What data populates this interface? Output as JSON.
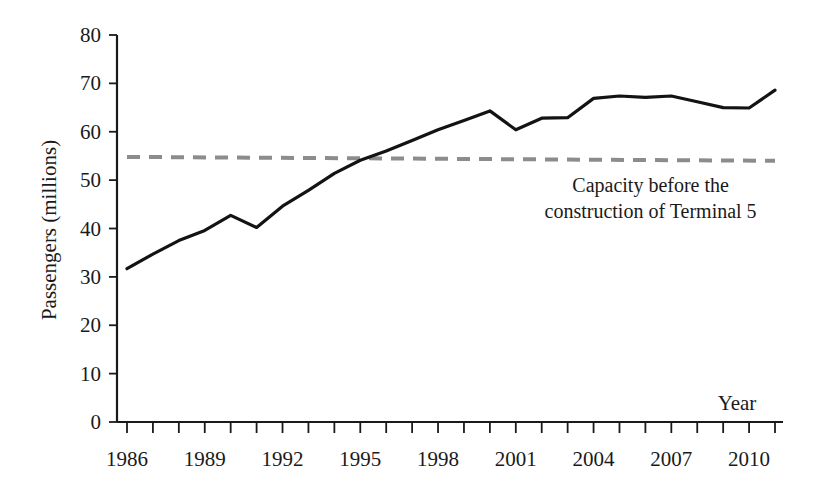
{
  "chart_data": {
    "type": "line",
    "title": "",
    "xlabel": "Year",
    "ylabel": "Passengers (millions)",
    "xlim": [
      1986,
      2011
    ],
    "ylim": [
      0,
      80
    ],
    "grid": false,
    "legend": "none",
    "y_ticks": [
      0,
      10,
      20,
      30,
      40,
      50,
      60,
      70,
      80
    ],
    "y_tick_labels": [
      "0",
      "10",
      "20",
      "30",
      "40",
      "50",
      "60",
      "70",
      "80"
    ],
    "x_ticks": [
      1986,
      1987,
      1988,
      1989,
      1990,
      1991,
      1992,
      1993,
      1994,
      1995,
      1996,
      1997,
      1998,
      1999,
      2000,
      2001,
      2002,
      2003,
      2004,
      2005,
      2006,
      2007,
      2008,
      2009,
      2010,
      2011
    ],
    "x_tick_labels_shown": [
      "1986",
      "1989",
      "1992",
      "1995",
      "1998",
      "2001",
      "2004",
      "2007",
      "2010"
    ],
    "x_tick_label_years": [
      1986,
      1989,
      1992,
      1995,
      1998,
      2001,
      2004,
      2007,
      2010
    ],
    "series": [
      {
        "name": "Passengers",
        "style": "solid",
        "color": "#131313",
        "x": [
          1986,
          1987,
          1988,
          1989,
          1990,
          1991,
          1992,
          1993,
          1994,
          1995,
          1996,
          1997,
          1998,
          1999,
          2000,
          2001,
          2002,
          2003,
          2004,
          2005,
          2006,
          2007,
          2008,
          2009,
          2010,
          2011
        ],
        "values": [
          31.7,
          34.7,
          37.5,
          39.6,
          42.7,
          40.2,
          44.6,
          47.9,
          51.4,
          54.1,
          56.0,
          58.2,
          60.4,
          62.3,
          64.3,
          60.4,
          62.8,
          62.9,
          66.9,
          67.4,
          67.1,
          67.4,
          66.2,
          65.0,
          64.9,
          68.6
        ]
      }
    ],
    "reference_line": {
      "name": "Capacity before the construction of Terminal 5",
      "style": "dashed",
      "color": "#8c8c8c",
      "x": [
        1986,
        2011
      ],
      "values": [
        54.8,
        54.0
      ]
    },
    "annotations": [
      {
        "name": "capacity-annotation",
        "lines": [
          "Capacity  before the",
          "construction of Terminal 5"
        ],
        "x": 2006.2,
        "y": 47.5
      }
    ]
  },
  "labels": {
    "y_axis_title": "Passengers (millions)",
    "x_axis_title": "Year",
    "annotation_line1": "Capacity  before the",
    "annotation_line2": "construction of Terminal 5"
  },
  "colors": {
    "series": "#131313",
    "capacity": "#8c8c8c",
    "axis": "#1a1a1a",
    "background": "#ffffff"
  }
}
